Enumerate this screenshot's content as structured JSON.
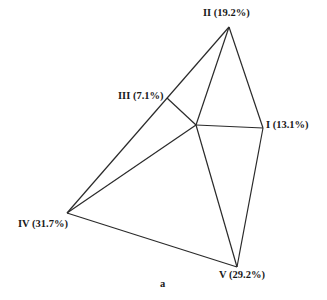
{
  "diagram": {
    "caption": "a",
    "vertices": [
      {
        "id": "I",
        "label": "I (13.1%)",
        "x": 263,
        "y": 128
      },
      {
        "id": "II",
        "label": "II (19.2%)",
        "x": 229,
        "y": 27
      },
      {
        "id": "III",
        "label": "III (7.1%)",
        "x": 167,
        "y": 98
      },
      {
        "id": "IV",
        "label": "IV (31.7%)",
        "x": 67,
        "y": 213
      },
      {
        "id": "V",
        "label": "V (29.2%)",
        "x": 237,
        "y": 267
      }
    ],
    "center": {
      "x": 196,
      "y": 125
    },
    "line_color": "#2a2a2a"
  }
}
